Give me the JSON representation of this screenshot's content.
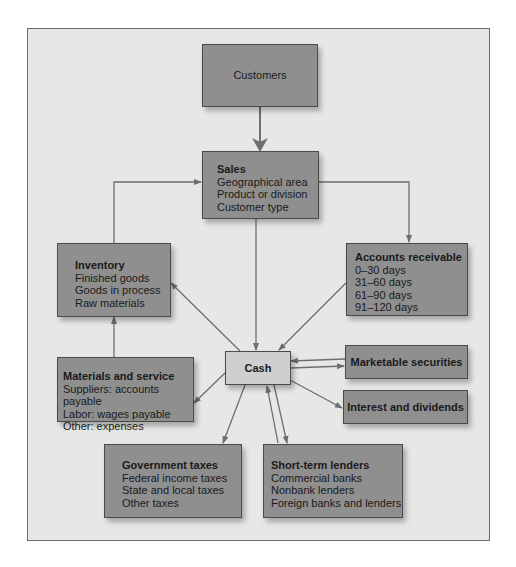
{
  "diagram": {
    "colors": {
      "background": "#e7e7e6",
      "box_fill": "#8f8f8f",
      "cash_fill": "#cfcfcf",
      "arrow": "#6e6e6e",
      "text": "#1a1a1a"
    },
    "nodes": {
      "customers": {
        "title": "Customers",
        "lines": []
      },
      "sales": {
        "title": "Sales",
        "lines": [
          "Geographical area",
          "Product or division",
          "Customer type"
        ]
      },
      "inventory": {
        "title": "Inventory",
        "lines": [
          "Finished goods",
          "Goods in process",
          "Raw materials"
        ]
      },
      "accounts_receivable": {
        "title": "Accounts receivable",
        "lines": [
          "0–30 days",
          "31–60 days",
          "61–90 days",
          "91–120 days"
        ]
      },
      "cash": {
        "title": "Cash",
        "lines": []
      },
      "marketable_securities": {
        "title": "Marketable securities",
        "lines": []
      },
      "interest_dividends": {
        "title": "Interest and dividends",
        "lines": []
      },
      "materials_service": {
        "title": "Materials and service",
        "lines": [
          "Suppliers: accounts payable",
          "Labor: wages payable",
          "Other: expenses"
        ]
      },
      "government_taxes": {
        "title": "Government taxes",
        "lines": [
          "Federal income taxes",
          "State and local taxes",
          "Other taxes"
        ]
      },
      "short_term_lenders": {
        "title": "Short-term lenders",
        "lines": [
          "Commercial banks",
          "Nonbank lenders",
          "Foreign banks and lenders"
        ]
      }
    },
    "edges": [
      {
        "from": "Customers",
        "to": "Sales"
      },
      {
        "from": "Sales",
        "to": "Accounts receivable"
      },
      {
        "from": "Sales",
        "to": "Cash"
      },
      {
        "from": "Inventory",
        "to": "Sales"
      },
      {
        "from": "Accounts receivable",
        "to": "Cash"
      },
      {
        "from": "Cash",
        "to": "Inventory"
      },
      {
        "from": "Materials and service",
        "to": "Inventory"
      },
      {
        "from": "Cash",
        "to": "Materials and service"
      },
      {
        "from": "Cash",
        "to": "Marketable securities"
      },
      {
        "from": "Marketable securities",
        "to": "Cash"
      },
      {
        "from": "Cash",
        "to": "Interest and dividends"
      },
      {
        "from": "Cash",
        "to": "Government taxes"
      },
      {
        "from": "Cash",
        "to": "Short-term lenders"
      },
      {
        "from": "Short-term lenders",
        "to": "Cash"
      }
    ]
  }
}
